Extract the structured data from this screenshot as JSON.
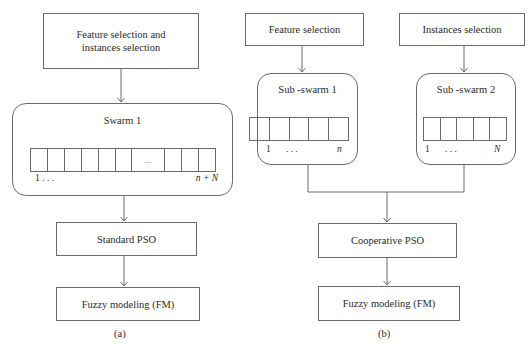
{
  "diagram_a": {
    "caption": "(a)",
    "input_box": {
      "line1": "Feature selection and",
      "line2": "instances selection"
    },
    "swarm": {
      "title": "Swarm 1",
      "cell_count": 11,
      "ellipsis": "...",
      "label_start": "1 . . .",
      "label_end": "n + N"
    },
    "optimizer_box": "Standard PSO",
    "model_box": "Fuzzy modeling (FM)"
  },
  "diagram_b": {
    "caption": "(b)",
    "input_left": "Feature selection",
    "input_right": "Instances selection",
    "subswarm_1": {
      "title": "Sub -swarm 1",
      "cell_count": 5,
      "label_start": "1",
      "label_dots": ". . .",
      "label_end": "n"
    },
    "subswarm_2": {
      "title": "Sub -swarm 2",
      "cell_count": 5,
      "label_start": "1",
      "label_dots": ". . .",
      "label_end": "N"
    },
    "optimizer_box": "Cooperative PSO",
    "model_box": "Fuzzy modeling (FM)"
  },
  "colors": {
    "stroke": "#6a6a6a",
    "text": "#2a2a2a",
    "background": "#ffffff"
  }
}
